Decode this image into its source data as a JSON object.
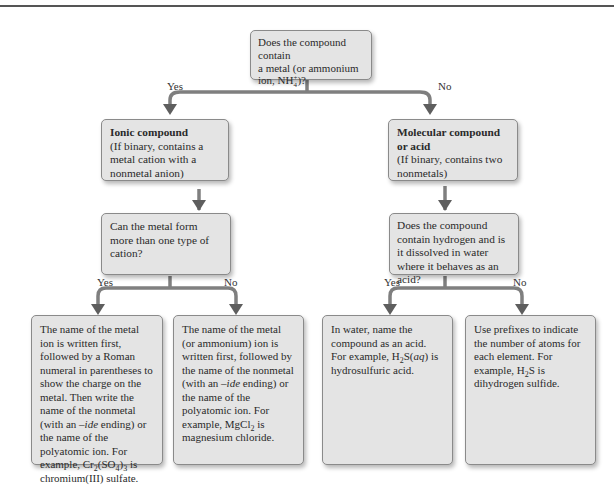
{
  "diagram": {
    "type": "flowchart",
    "nodes": {
      "root": {
        "text_line1": "Does the compound contain",
        "text_line2": "a metal (or ammonium",
        "text_line3_pre": "ion, NH",
        "text_line3_sup": "+",
        "text_line3_sub": "4",
        "text_line3_post": ")?"
      },
      "ionic": {
        "title": "Ionic compound",
        "desc": "(If binary, contains a metal cation with a nonmetal anion)"
      },
      "molecular": {
        "title": "Molecular compound or acid",
        "desc": "(If binary, contains two nonmetals)"
      },
      "cation_question": {
        "text": "Can the metal form more than one type of cation?"
      },
      "acid_question": {
        "text": "Does the compound contain hydrogen and is it dissolved in water where it behaves as an acid?"
      },
      "leaf_multi_cation": {
        "text_a": "The name of the metal ion is written first, followed by a Roman numeral in parentheses to show the charge on the metal. Then write the name of the nonmetal (with an ",
        "text_ide": "–ide",
        "text_b": " ending) or the name of the polyatomic ion. For example, Cr",
        "sub1": "2",
        "text_c": "(SO",
        "sub2": "4",
        "text_d": ")",
        "sub3": "3",
        "text_e": " is chromium(III) sulfate."
      },
      "leaf_single_cation": {
        "text_a": "The name of the metal (or ammonium) ion is written first, followed by the name of the nonmetal (with an ",
        "text_ide": "–ide",
        "text_b": " ending) or the name of the polyatomic ion. For example, MgCl",
        "sub1": "2",
        "text_c": " is magnesium chloride."
      },
      "leaf_acid": {
        "text_a": "In water, name the compound as an acid. For example, H",
        "sub1": "2",
        "text_b": "S(",
        "italic": "aq",
        "text_c": ") is hydrosulfuric acid."
      },
      "leaf_molecular": {
        "text_a": "Use prefixes to indicate the number of atoms for each element. For example, H",
        "sub1": "2",
        "text_b": "S is dihydrogen sulfide."
      }
    },
    "edge_labels": {
      "root_yes": "Yes",
      "root_no": "No",
      "cation_yes": "Yes",
      "cation_no": "No",
      "acid_yes": "Yes",
      "acid_no": "No"
    },
    "colors": {
      "box_fill": "#e4e4e4",
      "box_border": "#8a8a8a",
      "connector": "#7a7a7a",
      "arrowhead": "#5e5e5e",
      "top_rule": "#555555"
    }
  }
}
